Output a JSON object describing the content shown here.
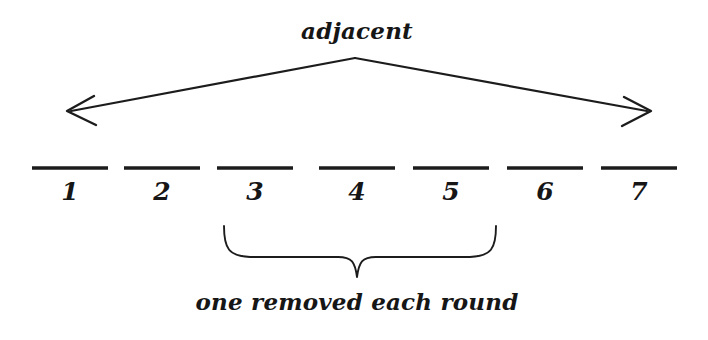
{
  "diagram": {
    "title_label": "adjacent",
    "bracket_label": "one removed each round",
    "background_color": "#ffffff",
    "ink_color": "#1c1c1c",
    "slots": [
      {
        "label": "1",
        "cx": 70
      },
      {
        "label": "2",
        "cx": 162
      },
      {
        "label": "3",
        "cx": 255
      },
      {
        "label": "4",
        "cx": 357
      },
      {
        "label": "5",
        "cx": 451
      },
      {
        "label": "6",
        "cx": 545
      },
      {
        "label": "7",
        "cx": 639
      }
    ],
    "blanks": {
      "y": 168,
      "line_half_width": 38,
      "count": 7
    },
    "arrow": {
      "apex_x": 355,
      "apex_y": 58,
      "left_tip_x": 68,
      "left_tip_y": 112,
      "right_tip_x": 650,
      "right_tip_y": 112,
      "direction": "double-headed"
    },
    "brace": {
      "left_x": 224,
      "right_x": 496,
      "top_y": 225,
      "stem_x": 357,
      "stem_y": 278,
      "spans_slots": "3-5"
    }
  }
}
